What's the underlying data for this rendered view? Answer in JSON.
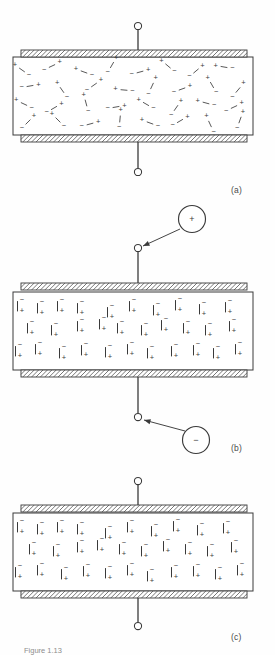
{
  "figure": {
    "background": "#fefefe",
    "ink": "#3a3a3a",
    "hatch_color": "#4a4a4a",
    "panels": [
      {
        "id": "a",
        "label": "(a)",
        "state": "unpolarized",
        "description": "Randomly oriented dipoles in the dielectric with no applied charge",
        "box": {
          "x": 13,
          "y": 57,
          "width": 240,
          "height": 78
        },
        "top_plate": {
          "x": 21,
          "y": 50,
          "width": 226,
          "height": 7
        },
        "bottom_plate": {
          "x": 21,
          "y": 135,
          "width": 226,
          "height": 7
        },
        "top_lead": {
          "x": 138,
          "y_top": 30,
          "y_bottom": 50
        },
        "bottom_lead": {
          "x": 138,
          "y_top": 142,
          "y_bottom": 168
        },
        "top_terminal": {
          "cx": 138,
          "cy": 26,
          "r": 3.6
        },
        "bottom_terminal": {
          "cx": 138,
          "cy": 172,
          "r": 3.6
        },
        "external_charges": []
      },
      {
        "id": "b",
        "label": "(b)",
        "state": "polarizing",
        "description": "Charge being delivered to the plates; dipoles align with the field",
        "box": {
          "x": 13,
          "y": 292,
          "width": 240,
          "height": 78
        },
        "top_plate": {
          "x": 21,
          "y": 283,
          "width": 226,
          "height": 7
        },
        "bottom_plate": {
          "x": 21,
          "y": 370,
          "width": 226,
          "height": 7
        },
        "top_lead": {
          "x": 138,
          "y_top": 252,
          "y_bottom": 283
        },
        "bottom_lead": {
          "x": 138,
          "y_top": 377,
          "y_bottom": 413
        },
        "top_terminal": {
          "cx": 138,
          "cy": 248,
          "r": 3.6
        },
        "bottom_terminal": {
          "cx": 138,
          "cy": 417,
          "r": 3.6
        },
        "external_charges": [
          {
            "sign": "+",
            "cx": 192,
            "cy": 219,
            "r": 13.5,
            "arrow_from": {
              "x": 180,
              "y": 229
            },
            "arrow_to": {
              "x": 143,
              "y": 246
            }
          },
          {
            "sign": "−",
            "cx": 196,
            "cy": 440,
            "r": 13.5,
            "arrow_from": {
              "x": 185,
              "y": 431
            },
            "arrow_to": {
              "x": 144,
              "y": 420
            }
          }
        ]
      },
      {
        "id": "c",
        "label": "(c)",
        "state": "polarized",
        "description": "Fully polarized dielectric with dipoles aligned",
        "box": {
          "x": 13,
          "y": 513,
          "width": 240,
          "height": 78
        },
        "top_plate": {
          "x": 21,
          "y": 505,
          "width": 226,
          "height": 7
        },
        "bottom_plate": {
          "x": 21,
          "y": 591,
          "width": 226,
          "height": 7
        },
        "top_lead": {
          "x": 138,
          "y_top": 485,
          "y_bottom": 505
        },
        "bottom_lead": {
          "x": 138,
          "y_top": 598,
          "y_bottom": 622
        },
        "top_terminal": {
          "cx": 138,
          "cy": 481,
          "r": 3.6
        },
        "bottom_terminal": {
          "cx": 138,
          "cy": 626,
          "r": 3.6
        },
        "external_charges": []
      }
    ],
    "charge_symbols": {
      "positive": "+",
      "negative": "−"
    },
    "random_dipoles": [
      {
        "x": 22,
        "y": 70,
        "angle": 35
      },
      {
        "x": 52,
        "y": 66,
        "angle": 155
      },
      {
        "x": 84,
        "y": 72,
        "angle": 20
      },
      {
        "x": 112,
        "y": 65,
        "angle": 120
      },
      {
        "x": 140,
        "y": 72,
        "angle": 165
      },
      {
        "x": 168,
        "y": 66,
        "angle": 40
      },
      {
        "x": 196,
        "y": 71,
        "angle": 140
      },
      {
        "x": 224,
        "y": 67,
        "angle": 10
      },
      {
        "x": 30,
        "y": 86,
        "angle": 170
      },
      {
        "x": 62,
        "y": 90,
        "angle": 55
      },
      {
        "x": 94,
        "y": 85,
        "angle": 145
      },
      {
        "x": 124,
        "y": 90,
        "angle": 5
      },
      {
        "x": 152,
        "y": 86,
        "angle": 115
      },
      {
        "x": 182,
        "y": 89,
        "angle": 160
      },
      {
        "x": 212,
        "y": 85,
        "angle": 60
      },
      {
        "x": 238,
        "y": 90,
        "angle": 130
      },
      {
        "x": 24,
        "y": 104,
        "angle": 25
      },
      {
        "x": 54,
        "y": 108,
        "angle": 150
      },
      {
        "x": 86,
        "y": 103,
        "angle": 75
      },
      {
        "x": 116,
        "y": 107,
        "angle": 170
      },
      {
        "x": 146,
        "y": 104,
        "angle": 30
      },
      {
        "x": 176,
        "y": 108,
        "angle": 125
      },
      {
        "x": 206,
        "y": 103,
        "angle": 15
      },
      {
        "x": 234,
        "y": 107,
        "angle": 155
      },
      {
        "x": 28,
        "y": 122,
        "angle": 135
      },
      {
        "x": 58,
        "y": 120,
        "angle": 45
      },
      {
        "x": 90,
        "y": 124,
        "angle": 165
      },
      {
        "x": 120,
        "y": 119,
        "angle": 95
      },
      {
        "x": 150,
        "y": 123,
        "angle": 20
      },
      {
        "x": 180,
        "y": 121,
        "angle": 150
      },
      {
        "x": 210,
        "y": 124,
        "angle": 65
      },
      {
        "x": 240,
        "y": 120,
        "angle": 110
      }
    ],
    "aligned_dipoles": [
      {
        "x": 22,
        "y": 300
      },
      {
        "x": 42,
        "y": 302
      },
      {
        "x": 62,
        "y": 300
      },
      {
        "x": 82,
        "y": 302
      },
      {
        "x": 112,
        "y": 306
      },
      {
        "x": 134,
        "y": 300
      },
      {
        "x": 158,
        "y": 304
      },
      {
        "x": 180,
        "y": 299
      },
      {
        "x": 204,
        "y": 303
      },
      {
        "x": 230,
        "y": 301
      },
      {
        "x": 32,
        "y": 322
      },
      {
        "x": 56,
        "y": 324
      },
      {
        "x": 82,
        "y": 320
      },
      {
        "x": 104,
        "y": 318
      },
      {
        "x": 122,
        "y": 322
      },
      {
        "x": 146,
        "y": 324
      },
      {
        "x": 166,
        "y": 319
      },
      {
        "x": 188,
        "y": 322
      },
      {
        "x": 210,
        "y": 324
      },
      {
        "x": 234,
        "y": 320
      },
      {
        "x": 20,
        "y": 345
      },
      {
        "x": 40,
        "y": 343
      },
      {
        "x": 64,
        "y": 347
      },
      {
        "x": 86,
        "y": 344
      },
      {
        "x": 110,
        "y": 346
      },
      {
        "x": 132,
        "y": 343
      },
      {
        "x": 152,
        "y": 347
      },
      {
        "x": 176,
        "y": 345
      },
      {
        "x": 198,
        "y": 344
      },
      {
        "x": 218,
        "y": 347
      },
      {
        "x": 240,
        "y": 343
      }
    ],
    "aligned_dipoles_c": [
      {
        "x": 22,
        "y": 521
      },
      {
        "x": 42,
        "y": 523
      },
      {
        "x": 62,
        "y": 521
      },
      {
        "x": 82,
        "y": 523
      },
      {
        "x": 110,
        "y": 527
      },
      {
        "x": 132,
        "y": 521
      },
      {
        "x": 156,
        "y": 525
      },
      {
        "x": 178,
        "y": 520
      },
      {
        "x": 202,
        "y": 524
      },
      {
        "x": 228,
        "y": 522
      },
      {
        "x": 34,
        "y": 543
      },
      {
        "x": 58,
        "y": 545
      },
      {
        "x": 82,
        "y": 541
      },
      {
        "x": 102,
        "y": 539
      },
      {
        "x": 124,
        "y": 543
      },
      {
        "x": 146,
        "y": 545
      },
      {
        "x": 168,
        "y": 540
      },
      {
        "x": 190,
        "y": 543
      },
      {
        "x": 212,
        "y": 545
      },
      {
        "x": 236,
        "y": 541
      },
      {
        "x": 20,
        "y": 566
      },
      {
        "x": 42,
        "y": 564
      },
      {
        "x": 66,
        "y": 568
      },
      {
        "x": 88,
        "y": 565
      },
      {
        "x": 110,
        "y": 567
      },
      {
        "x": 132,
        "y": 564
      },
      {
        "x": 152,
        "y": 570
      },
      {
        "x": 176,
        "y": 566
      },
      {
        "x": 198,
        "y": 565
      },
      {
        "x": 220,
        "y": 568
      },
      {
        "x": 242,
        "y": 564
      }
    ]
  },
  "caption": {
    "text": "Figure 1.13"
  }
}
